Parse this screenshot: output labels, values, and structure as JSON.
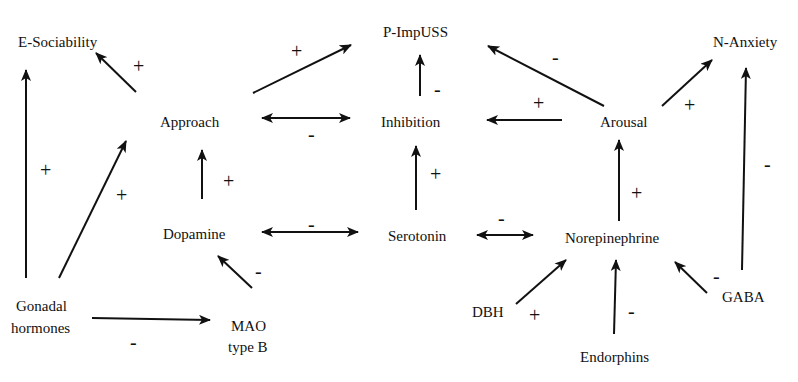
{
  "nodes": {
    "e_sociability": {
      "label": "E-Sociability",
      "x": 18,
      "y": 47
    },
    "p_impuss": {
      "label": "P-ImpUSS",
      "x": 383,
      "y": 37
    },
    "n_anxiety": {
      "label": "N-Anxiety",
      "x": 713,
      "y": 47
    },
    "approach": {
      "label": "Approach",
      "x": 160,
      "y": 127
    },
    "inhibition": {
      "label": "Inhibition",
      "x": 381,
      "y": 127
    },
    "arousal": {
      "label": "Arousal",
      "x": 600,
      "y": 127
    },
    "dopamine": {
      "label": "Dopamine",
      "x": 163,
      "y": 239
    },
    "serotonin": {
      "label": "Serotonin",
      "x": 388,
      "y": 241
    },
    "norepinephrine": {
      "label": "Norepinephrine",
      "x": 565,
      "y": 243
    },
    "gonadal_line1": {
      "label": "Gonadal",
      "x": 16,
      "y": 311
    },
    "gonadal_line2": {
      "label": "hormones",
      "x": 11,
      "y": 333
    },
    "mao_line1": {
      "label": "MAO",
      "x": 231,
      "y": 331
    },
    "mao_line2": {
      "label": "type B",
      "x": 228,
      "y": 352
    },
    "dbh": {
      "label": "DBH",
      "x": 472,
      "y": 317
    },
    "endorphins": {
      "label": "Endorphins",
      "x": 580,
      "y": 362
    },
    "gaba": {
      "label": "GABA",
      "x": 722,
      "y": 302
    }
  },
  "edges": [
    {
      "id": "approach-to-esociability",
      "from": "Approach",
      "to": "E-Sociability",
      "sign": "+",
      "x1": 136,
      "y1": 92,
      "x2": 96,
      "y2": 53,
      "sx": 133,
      "sy": 73,
      "arrow": "end"
    },
    {
      "id": "gonadal-to-esociability",
      "from": "Gonadal hormones",
      "to": "E-Sociability",
      "sign": "+",
      "x1": 26,
      "y1": 278,
      "x2": 26,
      "y2": 70,
      "sx": 40,
      "sy": 177,
      "arrow": "end"
    },
    {
      "id": "gonadal-to-approach",
      "from": "Gonadal hormones",
      "to": "Approach",
      "sign": "+",
      "x1": 59,
      "y1": 278,
      "x2": 126,
      "y2": 141,
      "sx": 116,
      "sy": 202,
      "arrow": "end"
    },
    {
      "id": "approach-to-pimpuss",
      "from": "Approach",
      "to": "P-ImpUSS",
      "sign": "+",
      "x1": 253,
      "y1": 93,
      "x2": 351,
      "y2": 45,
      "sx": 291,
      "sy": 58,
      "arrow": "end"
    },
    {
      "id": "approach-inhibition",
      "from": "Approach",
      "to": "Inhibition",
      "sign": "-",
      "x1": 262,
      "y1": 118,
      "x2": 350,
      "y2": 118,
      "sx": 308,
      "sy": 141,
      "arrow": "both"
    },
    {
      "id": "inhibition-to-pimpuss",
      "from": "Inhibition",
      "to": "P-ImpUSS",
      "sign": "-",
      "x1": 420,
      "y1": 96,
      "x2": 420,
      "y2": 55,
      "sx": 434,
      "sy": 96,
      "arrow": "end"
    },
    {
      "id": "arousal-to-pimpuss",
      "from": "Arousal",
      "to": "P-ImpUSS",
      "sign": "-",
      "x1": 604,
      "y1": 106,
      "x2": 488,
      "y2": 46,
      "sx": 552,
      "sy": 64,
      "arrow": "end"
    },
    {
      "id": "arousal-to-inhibition",
      "from": "Arousal",
      "to": "Inhibition",
      "sign": "+",
      "x1": 562,
      "y1": 120,
      "x2": 487,
      "y2": 120,
      "sx": 533,
      "sy": 110,
      "arrow": "end"
    },
    {
      "id": "arousal-to-nanxiety",
      "from": "Arousal",
      "to": "N-Anxiety",
      "sign": "+",
      "x1": 662,
      "y1": 106,
      "x2": 712,
      "y2": 60,
      "sx": 684,
      "sy": 112,
      "arrow": "end"
    },
    {
      "id": "dopamine-to-approach",
      "from": "Dopamine",
      "to": "Approach",
      "sign": "+",
      "x1": 202,
      "y1": 199,
      "x2": 202,
      "y2": 150,
      "sx": 223,
      "sy": 188,
      "arrow": "end"
    },
    {
      "id": "serotonin-to-inhibition",
      "from": "Serotonin",
      "to": "Inhibition",
      "sign": "+",
      "x1": 416,
      "y1": 210,
      "x2": 416,
      "y2": 146,
      "sx": 430,
      "sy": 181,
      "arrow": "end"
    },
    {
      "id": "norepinephrine-to-arousal",
      "from": "Norepinephrine",
      "to": "Arousal",
      "sign": "+",
      "x1": 619,
      "y1": 221,
      "x2": 619,
      "y2": 140,
      "sx": 631,
      "sy": 200,
      "arrow": "end"
    },
    {
      "id": "gaba-to-nanxiety",
      "from": "GABA",
      "to": "N-Anxiety",
      "sign": "-",
      "x1": 742,
      "y1": 270,
      "x2": 746,
      "y2": 68,
      "sx": 764,
      "sy": 171,
      "arrow": "end"
    },
    {
      "id": "dopamine-serotonin",
      "from": "Dopamine",
      "to": "Serotonin",
      "sign": "-",
      "x1": 262,
      "y1": 232,
      "x2": 358,
      "y2": 232,
      "sx": 308,
      "sy": 231,
      "arrow": "both"
    },
    {
      "id": "serotonin-norepinephrine",
      "from": "Serotonin",
      "to": "Norepinephrine",
      "sign": "-",
      "x1": 477,
      "y1": 235,
      "x2": 533,
      "y2": 235,
      "sx": 498,
      "sy": 225,
      "arrow": "both"
    },
    {
      "id": "mao-to-dopamine",
      "from": "MAO type B",
      "to": "Dopamine",
      "sign": "-",
      "x1": 252,
      "y1": 288,
      "x2": 218,
      "y2": 256,
      "sx": 255,
      "sy": 278,
      "arrow": "end"
    },
    {
      "id": "gonadal-to-mao",
      "from": "Gonadal hormones",
      "to": "MAO type B",
      "sign": "-",
      "x1": 92,
      "y1": 318,
      "x2": 210,
      "y2": 320,
      "sx": 130,
      "sy": 349,
      "arrow": "end"
    },
    {
      "id": "dbh-to-norepinephrine",
      "from": "DBH",
      "to": "Norepinephrine",
      "sign": "+",
      "x1": 516,
      "y1": 304,
      "x2": 566,
      "y2": 260,
      "sx": 529,
      "sy": 322,
      "arrow": "end"
    },
    {
      "id": "endorphins-to-norepinephrine",
      "from": "Endorphins",
      "to": "Norepinephrine",
      "sign": "-",
      "x1": 614,
      "y1": 334,
      "x2": 616,
      "y2": 260,
      "sx": 628,
      "sy": 318,
      "arrow": "end"
    },
    {
      "id": "gaba-to-norepinephrine",
      "from": "GABA",
      "to": "Norepinephrine",
      "sign": "-",
      "x1": 707,
      "y1": 293,
      "x2": 675,
      "y2": 262,
      "sx": 713,
      "sy": 283,
      "arrow": "end"
    }
  ]
}
